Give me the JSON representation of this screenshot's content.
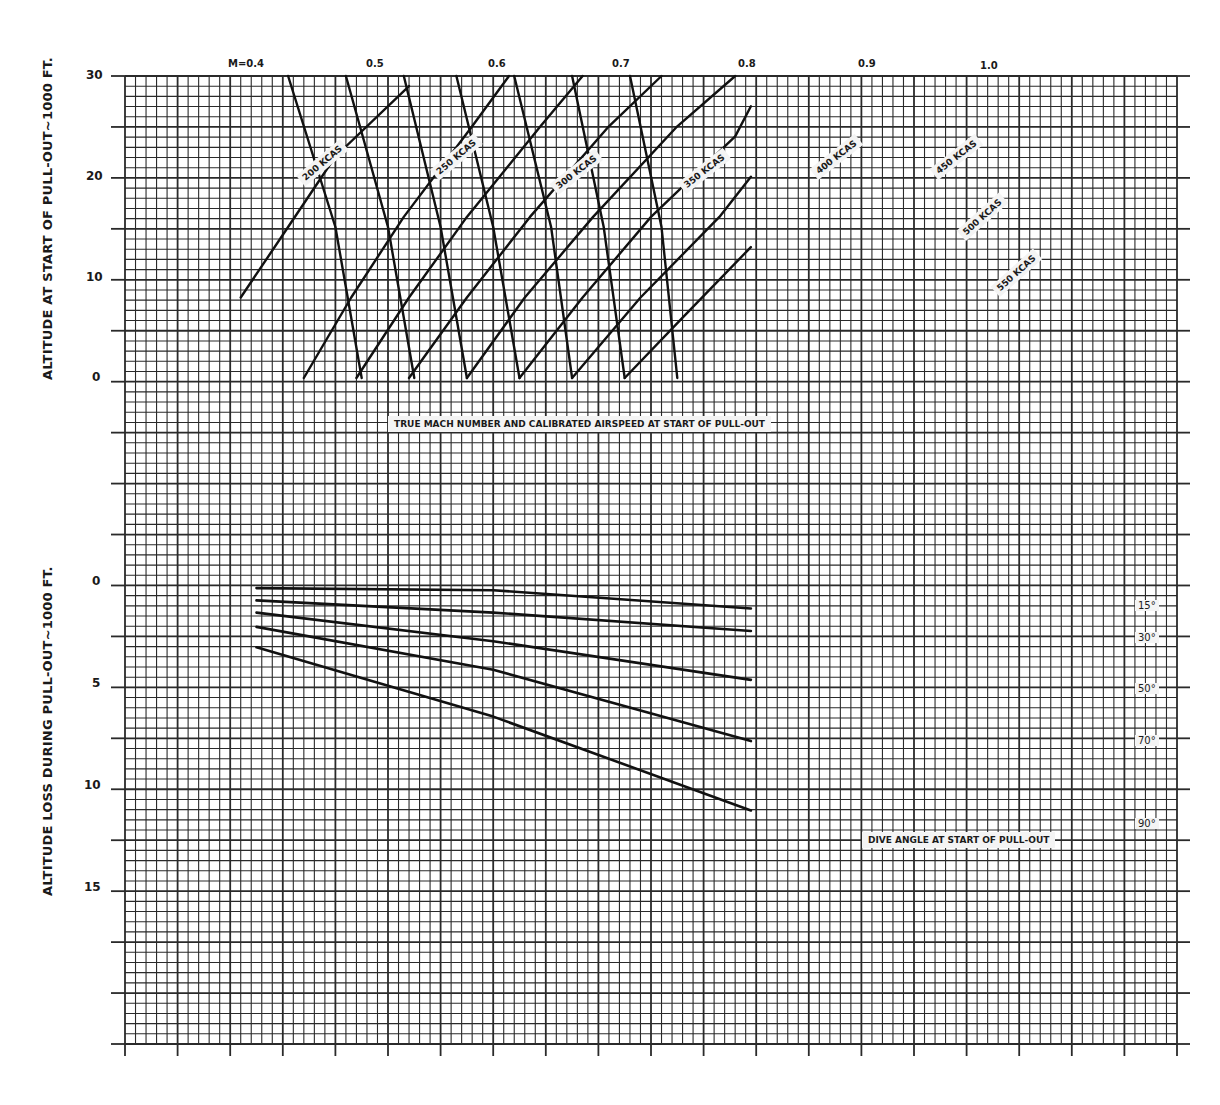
{
  "chart_data": [
    {
      "type": "line",
      "title": "Altitude at start of pull-out vs. true Mach number and calibrated airspeed",
      "xlabel": "TRUE MACH NUMBER AND CALIBRATED AIRSPEED AT START OF PULL-OUT",
      "ylabel": "ALTITUDE AT START OF PULL-OUT~1000 FT.",
      "ylim": [
        0,
        30
      ],
      "yticks": [
        "0",
        "10",
        "20",
        "30"
      ],
      "grid": true,
      "mach_lines": [
        {
          "name": "M=0.4",
          "label": "M=0.4",
          "points": [
            [
              0,
              4.5
            ],
            [
              15,
              4.0
            ],
            [
              30,
              3.1
            ]
          ]
        },
        {
          "name": "0.5",
          "label": "0.5",
          "points": [
            [
              0,
              5.5
            ],
            [
              15,
              5.0
            ],
            [
              30,
              4.2
            ]
          ]
        },
        {
          "name": "0.6",
          "label": "0.6",
          "points": [
            [
              0,
              6.5
            ],
            [
              15,
              6.0
            ],
            [
              30,
              5.3
            ]
          ]
        },
        {
          "name": "0.7",
          "label": "0.7",
          "points": [
            [
              0,
              7.5
            ],
            [
              15,
              7.0
            ],
            [
              30,
              6.3
            ]
          ]
        },
        {
          "name": "0.8",
          "label": "0.8",
          "points": [
            [
              0,
              8.5
            ],
            [
              15,
              8.1
            ],
            [
              30,
              7.4
            ]
          ]
        },
        {
          "name": "0.9",
          "label": "0.9",
          "points": [
            [
              0,
              9.5
            ],
            [
              15,
              9.1
            ],
            [
              30,
              8.5
            ]
          ]
        },
        {
          "name": "1.0",
          "label": "1.0",
          "points": [
            [
              0,
              10.5
            ],
            [
              15,
              10.2
            ],
            [
              30,
              9.6
            ]
          ]
        }
      ],
      "kcas_series": [
        {
          "name": "200 KCAS",
          "points": [
            [
              8,
              2.2
            ],
            [
              15,
              3.1
            ],
            [
              22,
              4.0
            ],
            [
              29,
              5.4
            ]
          ]
        },
        {
          "name": "250 KCAS",
          "points": [
            [
              0,
              3.4
            ],
            [
              8,
              4.3
            ],
            [
              16,
              5.3
            ],
            [
              25,
              6.6
            ],
            [
              30,
              7.3
            ]
          ]
        },
        {
          "name": "300 KCAS",
          "points": [
            [
              0,
              4.4
            ],
            [
              8,
              5.4
            ],
            [
              16,
              6.5
            ],
            [
              25,
              7.9
            ],
            [
              30,
              8.7
            ]
          ]
        },
        {
          "name": "350 KCAS",
          "points": [
            [
              0,
              5.4
            ],
            [
              8,
              6.5
            ],
            [
              16,
              7.7
            ],
            [
              25,
              9.2
            ],
            [
              30,
              10.2
            ]
          ]
        },
        {
          "name": "400 KCAS",
          "points": [
            [
              0,
              6.5
            ],
            [
              8,
              7.6
            ],
            [
              16,
              8.9
            ],
            [
              25,
              10.5
            ],
            [
              30,
              11.6
            ]
          ]
        },
        {
          "name": "450 KCAS",
          "points": [
            [
              0,
              7.5
            ],
            [
              8,
              8.7
            ],
            [
              16,
              10.0
            ],
            [
              24,
              11.6
            ],
            [
              27,
              11.9
            ]
          ]
        },
        {
          "name": "500 KCAS",
          "points": [
            [
              0,
              8.5
            ],
            [
              8,
              9.8
            ],
            [
              16,
              11.3
            ],
            [
              20,
              11.9
            ]
          ]
        },
        {
          "name": "550 KCAS",
          "points": [
            [
              0,
              9.5
            ],
            [
              6,
              10.6
            ],
            [
              13,
              11.9
            ]
          ]
        }
      ]
    },
    {
      "type": "line",
      "title": "Altitude loss during pull-out vs. dive angle",
      "xlabel": "DIVE ANGLE AT START OF PULL-OUT",
      "ylabel": "ALTITUDE LOSS DURING PULL-OUT~1000 FT.",
      "ylim": [
        0,
        15
      ],
      "yticks": [
        "0",
        "5",
        "10",
        "15"
      ],
      "y_inverted": true,
      "grid": true,
      "series": [
        {
          "name": "15°",
          "points": [
            [
              2.5,
              0.3
            ],
            [
              7,
              0.4
            ],
            [
              11.9,
              1.3
            ]
          ]
        },
        {
          "name": "30°",
          "points": [
            [
              2.5,
              0.9
            ],
            [
              7,
              1.5
            ],
            [
              11.9,
              2.4
            ]
          ]
        },
        {
          "name": "50°",
          "points": [
            [
              2.5,
              1.5
            ],
            [
              7,
              2.9
            ],
            [
              11.9,
              4.8
            ]
          ]
        },
        {
          "name": "70°",
          "points": [
            [
              2.5,
              2.2
            ],
            [
              7,
              4.3
            ],
            [
              11.9,
              7.8
            ]
          ]
        },
        {
          "name": "90°",
          "points": [
            [
              2.5,
              3.2
            ],
            [
              7,
              6.6
            ],
            [
              11.9,
              11.2
            ]
          ]
        }
      ]
    }
  ],
  "labels": {
    "upper_ylabel": "ALTITUDE AT START OF PULL-OUT~1000 FT.",
    "lower_ylabel": "ALTITUDE LOSS DURING PULL-OUT~1000 FT.",
    "upper_xlabel": "TRUE MACH NUMBER AND CALIBRATED AIRSPEED AT START OF PULL-OUT",
    "lower_xlabel": "DIVE ANGLE AT START OF PULL-OUT",
    "upper_ticks": [
      "30",
      "20",
      "10",
      "0"
    ],
    "lower_ticks": [
      "0",
      "5",
      "10",
      "15"
    ],
    "mach": [
      "M=0.4",
      "0.5",
      "0.6",
      "0.7",
      "0.8",
      "0.9",
      "1.0"
    ],
    "kcas": [
      "200 KCAS",
      "250 KCAS",
      "300 KCAS",
      "350 KCAS",
      "400 KCAS",
      "450 KCAS",
      "500 KCAS",
      "550 KCAS"
    ],
    "angles": [
      "15°",
      "30°",
      "50°",
      "70°",
      "90°"
    ]
  },
  "colors": {
    "background": "#ffffff",
    "grid": "#2a2a2a",
    "curve": "#111111",
    "label_bg": "#f4f4f4"
  }
}
